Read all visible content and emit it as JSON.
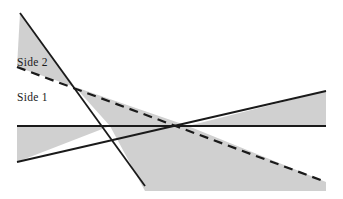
{
  "figure": {
    "background_color": "#ffffff",
    "shade_color": "#d0d0d0",
    "line_color": "#1a1a1a",
    "labels": {
      "side_2": "Side 2",
      "side_1": "Side 1"
    }
  },
  "chart_data": {
    "type": "line",
    "title": "",
    "xlabel": "",
    "ylabel": "",
    "grid": false,
    "legend_position": "inline-left",
    "xlim": [
      0,
      343
    ],
    "ylim": [
      199,
      0
    ],
    "annotations": [
      {
        "name": "side-2-label",
        "text": "Side 2",
        "x": 17,
        "y": 63
      },
      {
        "name": "side-1-label",
        "text": "Side 1",
        "x": 17,
        "y": 98
      }
    ],
    "series": [
      {
        "name": "horizontal-solid-line",
        "style": "solid",
        "color": "#1a1a1a",
        "x": [
          17,
          326
        ],
        "y": [
          126,
          126
        ]
      },
      {
        "name": "steep-descending-solid-line",
        "style": "solid",
        "color": "#1a1a1a",
        "x": [
          20,
          145
        ],
        "y": [
          13,
          186
        ]
      },
      {
        "name": "dashed-descending-line",
        "style": "dashed",
        "color": "#1a1a1a",
        "x": [
          17,
          326
        ],
        "y": [
          67,
          182
        ]
      },
      {
        "name": "rising-solid-line",
        "style": "solid",
        "color": "#1a1a1a",
        "x": [
          17,
          326
        ],
        "y": [
          162,
          91
        ]
      }
    ],
    "shaded_regions": [
      {
        "name": "top-left-triangle",
        "fill": "#d0d0d0",
        "points": [
          [
            20,
            13
          ],
          [
            17,
            67
          ],
          [
            75,
            87
          ]
        ]
      },
      {
        "name": "left-band-below-horizontal",
        "fill": "#d0d0d0",
        "points": [
          [
            17,
            126
          ],
          [
            110,
            126
          ],
          [
            17,
            162
          ]
        ]
      },
      {
        "name": "right-wedge-above-horizontal",
        "fill": "#d0d0d0",
        "points": [
          [
            188,
            126
          ],
          [
            326,
            91
          ],
          [
            326,
            126
          ]
        ]
      },
      {
        "name": "center-bottom-region",
        "fill": "#d0d0d0",
        "points": [
          [
            75,
            87
          ],
          [
            188,
            126
          ],
          [
            326,
            182
          ],
          [
            326,
            191
          ],
          [
            145,
            191
          ],
          [
            110,
            126
          ]
        ]
      }
    ],
    "intersections": [
      {
        "name": "upper-left-crossing",
        "x": 75,
        "y": 87
      },
      {
        "name": "central-convergence",
        "x": 188,
        "y": 126
      },
      {
        "name": "lower-left-crossing",
        "x": 110,
        "y": 126
      }
    ]
  }
}
